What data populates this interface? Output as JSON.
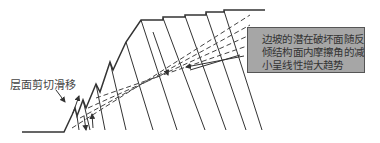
{
  "diagram": {
    "type": "slope cross-section with bedding planes",
    "annotations": {
      "shear_label": "层面剪切滑移",
      "note_lines": [
        "边坡的潜在破坏面随反",
        "倾结构面内摩擦角的减",
        "小呈线性增大趋势"
      ]
    },
    "colors": {
      "line": "#333333",
      "box_fill": "#a6a6a6",
      "box_border": "#555555",
      "background": "#ffffff"
    }
  }
}
